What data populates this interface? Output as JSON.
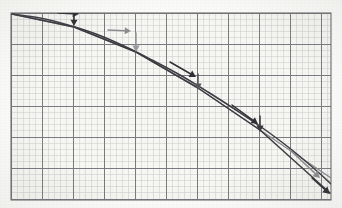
{
  "figure": {
    "background_color": "#fdfdfb",
    "paper_tint": "#f7f7f3",
    "plot_frame": {
      "x": 11,
      "y": 13,
      "width": 320,
      "height": 187,
      "border_color": "#6e6e72",
      "border_width": 1.1
    },
    "grid": {
      "minor_spacing_px": 6.2,
      "major_every": 5,
      "minor_color": "#c9c9cc",
      "major_color": "#7a7a80",
      "minor_width": 0.5,
      "major_width": 1.0,
      "visible": true
    }
  },
  "curves": {
    "true_curve": {
      "label": "exact solution curve",
      "color": "#3c3c42",
      "width": 1.5,
      "points": [
        [
          12,
          14
        ],
        [
          40,
          18
        ],
        [
          68,
          25
        ],
        [
          96,
          34
        ],
        [
          124,
          46
        ],
        [
          152,
          60
        ],
        [
          180,
          75
        ],
        [
          208,
          92
        ],
        [
          236,
          110
        ],
        [
          264,
          129
        ],
        [
          292,
          150
        ],
        [
          318,
          172
        ],
        [
          331,
          184
        ]
      ]
    },
    "euler_polyline": {
      "label": "piecewise linear approximation",
      "color": "#3a3a40",
      "width": 1.5,
      "points": [
        [
          12,
          14
        ],
        [
          74,
          27
        ],
        [
          136,
          52
        ],
        [
          198,
          88
        ],
        [
          260,
          130
        ],
        [
          330,
          193
        ]
      ]
    },
    "secondary_polyline": {
      "label": "secondary approximation",
      "color": "#8b8b90",
      "width": 1.4,
      "points": [
        [
          12,
          14
        ],
        [
          74,
          27
        ],
        [
          136,
          52
        ],
        [
          198,
          88
        ],
        [
          260,
          130
        ],
        [
          331,
          178
        ]
      ]
    }
  },
  "arrows": {
    "step_arrows": [
      {
        "name": "step-arrow-1",
        "color": "#2f2f35",
        "x1": 58,
        "y1": 13,
        "x2": 79,
        "y2": 14,
        "head": 5.0
      },
      {
        "name": "step-arrow-2",
        "color": "#8d8d92",
        "x1": 108,
        "y1": 30,
        "x2": 131,
        "y2": 31,
        "head": 5.0
      },
      {
        "name": "step-arrow-3",
        "color": "#2f2f35",
        "x1": 170,
        "y1": 62,
        "x2": 196,
        "y2": 77,
        "head": 5.2
      },
      {
        "name": "step-arrow-4",
        "color": "#2f2f35",
        "x1": 232,
        "y1": 105,
        "x2": 258,
        "y2": 124,
        "head": 5.2
      },
      {
        "name": "step-arrow-5",
        "color": "#8d8d92",
        "x1": 290,
        "y1": 150,
        "x2": 320,
        "y2": 178,
        "head": 5.4
      }
    ],
    "drop_arrows": [
      {
        "name": "drop-arrow-1",
        "color": "#2f2f35",
        "x1": 74,
        "y1": 13,
        "x2": 74,
        "y2": 26,
        "head": 5.0
      },
      {
        "name": "drop-arrow-2",
        "color": "#9a9a9f",
        "x1": 136,
        "y1": 33,
        "x2": 136,
        "y2": 52,
        "head": 5.2
      },
      {
        "name": "drop-arrow-3",
        "color": "#56565c",
        "x1": 198,
        "y1": 74,
        "x2": 198,
        "y2": 90,
        "head": 5.2
      },
      {
        "name": "drop-arrow-4",
        "color": "#3a3a40",
        "x1": 260,
        "y1": 116,
        "x2": 260,
        "y2": 132,
        "head": 5.2
      },
      {
        "name": "drop-arrow-5",
        "color": "#2f2f35",
        "x1": 312,
        "y1": 178,
        "x2": 330,
        "y2": 194,
        "head": 5.6
      }
    ]
  },
  "nodes": [
    {
      "name": "node-0",
      "x": 12,
      "y": 14
    },
    {
      "name": "node-1",
      "x": 74,
      "y": 27
    },
    {
      "name": "node-2",
      "x": 136,
      "y": 52
    },
    {
      "name": "node-3",
      "x": 198,
      "y": 88
    },
    {
      "name": "node-4",
      "x": 260,
      "y": 130
    },
    {
      "name": "node-5",
      "x": 330,
      "y": 192
    }
  ]
}
